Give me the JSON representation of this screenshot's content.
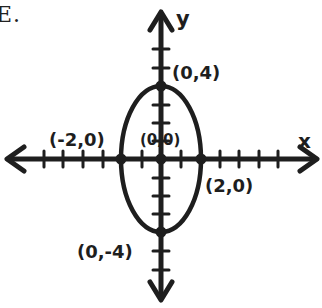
{
  "corner_label": "E.",
  "axes": {
    "x_label": "x",
    "y_label": "y"
  },
  "points": [
    {
      "id": "top-vertex",
      "label": "(0,4)",
      "x": 0,
      "y": 4
    },
    {
      "id": "bottom-vertex",
      "label": "(0,-4)",
      "x": 0,
      "y": -4
    },
    {
      "id": "left-covertex",
      "label": "(-2,0)",
      "x": -2,
      "y": 0
    },
    {
      "id": "right-covertex",
      "label": "(2,0)",
      "x": 2,
      "y": 0
    },
    {
      "id": "center",
      "label": "(0,0)",
      "x": 0,
      "y": 0
    }
  ],
  "labels": {
    "top": "(0,4)",
    "bottom": "(0,-4)",
    "left": "(-2,0)",
    "right": "(2,0)",
    "center": "(0,0)"
  },
  "ellipse": {
    "center": [
      0,
      0
    ],
    "semi_major_axis": 4,
    "semi_minor_axis": 2,
    "orientation": "vertical",
    "equation": "x^2/4 + y^2/16 = 1"
  },
  "grid": {
    "x_ticks": [
      -7,
      -6,
      -5,
      -4,
      -3,
      -2,
      -1,
      1,
      2,
      3,
      4,
      5,
      6,
      7
    ],
    "y_ticks": [
      -7,
      -6,
      -5,
      -4,
      -3,
      -2,
      -1,
      1,
      2,
      3,
      4,
      5,
      6,
      7
    ]
  },
  "colors": {
    "ink": "#1e1e1e",
    "background": "#ffffff"
  }
}
